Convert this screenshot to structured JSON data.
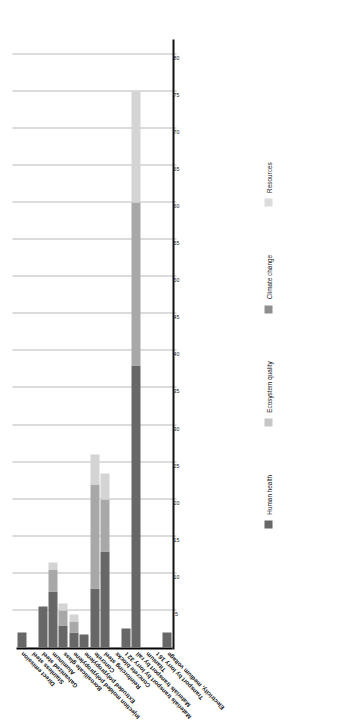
{
  "chart_data": {
    "type": "bar",
    "orientation": "horizontal-rotated",
    "title": "",
    "xlabel": "",
    "ylabel": "",
    "xlim": [
      0,
      82
    ],
    "grid": true,
    "ticks": [
      "5",
      "10",
      "15",
      "20",
      "25",
      "30",
      "35",
      "40",
      "45",
      "50",
      "55",
      "60",
      "65",
      "70",
      "75",
      "80"
    ],
    "tick_values": [
      5,
      10,
      15,
      20,
      25,
      30,
      35,
      40,
      45,
      50,
      55,
      60,
      65,
      70,
      75,
      80
    ],
    "legend_position": "bottom",
    "categories": [
      "Direct emission",
      "Stainless steel",
      "Galvanized steel",
      "Aluminum",
      "Borosilicate glass",
      "Injection molded polypropylene",
      "Extruded polypropylene",
      "Concrete",
      "Reinforcing steel",
      "Concrete blocks",
      "Materials transport by lorry 32 t",
      "Materials transport by rail",
      "Titanium",
      "Transport by lorry 16 t",
      "Electricity, medium voltage"
    ],
    "series": [
      {
        "name": "Human health",
        "color": "#676767",
        "values": [
          2.0,
          0.0,
          5.5,
          7.5,
          3.0,
          2.0,
          1.8,
          8.0,
          13.0,
          0.0,
          2.5,
          38.0,
          0.0,
          0.0,
          2.0
        ]
      },
      {
        "name": "Ecosystem quality",
        "color": "#a8a8a8",
        "values": [
          0.0,
          0.0,
          0.0,
          3.0,
          2.0,
          1.5,
          0.0,
          14.0,
          7.0,
          0.0,
          0.0,
          22.0,
          0.0,
          0.0,
          0.0
        ]
      },
      {
        "name": "Climate change",
        "color": "#8f8f8f",
        "values": [
          0.0,
          0.0,
          0.0,
          0.0,
          0.0,
          0.0,
          0.0,
          0.0,
          0.0,
          0.0,
          0.0,
          0.0,
          0.0,
          0.0,
          0.0
        ]
      },
      {
        "name": "Resources",
        "color": "#d4d4d4",
        "values": [
          0.0,
          0.0,
          0.0,
          1.0,
          1.0,
          1.0,
          0.0,
          4.0,
          3.5,
          0.0,
          0.0,
          15.0,
          0.0,
          0.0,
          0.0
        ]
      }
    ],
    "legend": [
      {
        "label": "Human health",
        "color": "#676767"
      },
      {
        "label": "Ecosystem quality",
        "color": "#c6c6c6"
      },
      {
        "label": "Climate change",
        "color": "#8f8f8f"
      },
      {
        "label": "Resources",
        "color": "#dcdcdc"
      }
    ]
  }
}
